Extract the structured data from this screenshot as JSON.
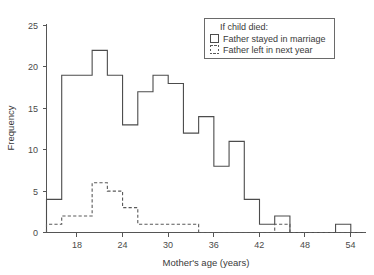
{
  "chart_data": {
    "type": "bar",
    "title": "",
    "xlabel": "Mother's age (years)",
    "ylabel": "Frequency",
    "xlim": [
      14,
      56
    ],
    "ylim": [
      0,
      25
    ],
    "xticks": [
      18,
      24,
      30,
      36,
      42,
      48,
      54
    ],
    "yticks": [
      0,
      5,
      10,
      15,
      20,
      25
    ],
    "grid": false,
    "bin_width": 2,
    "bin_edges": [
      14,
      16,
      18,
      20,
      22,
      24,
      26,
      28,
      30,
      32,
      34,
      36,
      38,
      40,
      42,
      44,
      46,
      48,
      50,
      52,
      54,
      56
    ],
    "legend_position": "top-right",
    "legend_title": "If child died:",
    "series": [
      {
        "name": "Father stayed in marriage",
        "style": "solid",
        "color": "#4c4c4c",
        "categories": [
          "14-16",
          "16-18",
          "18-20",
          "20-22",
          "22-24",
          "24-26",
          "26-28",
          "28-30",
          "30-32",
          "32-34",
          "34-36",
          "36-38",
          "38-40",
          "40-42",
          "42-44",
          "44-46",
          "46-48",
          "48-50",
          "50-52",
          "52-54",
          "54-56"
        ],
        "values": [
          4,
          19,
          19,
          22,
          19,
          13,
          17,
          19,
          18,
          12,
          14,
          8,
          11,
          4,
          1,
          2,
          0,
          0,
          0,
          1,
          0
        ]
      },
      {
        "name": "Father left in next year",
        "style": "dashed",
        "color": "#5a5a5a",
        "categories": [
          "14-16",
          "16-18",
          "18-20",
          "20-22",
          "22-24",
          "24-26",
          "26-28",
          "28-30",
          "30-32",
          "32-34",
          "34-36",
          "36-38",
          "38-40",
          "40-42",
          "42-44",
          "44-46",
          "46-48",
          "48-50",
          "50-52",
          "52-54",
          "54-56"
        ],
        "values": [
          1,
          2,
          2,
          6,
          5,
          3,
          1,
          1,
          1,
          1,
          0,
          0,
          0,
          0,
          0,
          1,
          0,
          0,
          0,
          0,
          0
        ]
      }
    ]
  },
  "axis": {
    "y_label": "Frequency",
    "x_label": "Mother's age (years)",
    "y_tick_labels": [
      "0",
      "5",
      "10",
      "15",
      "20",
      "25"
    ],
    "x_tick_labels": [
      "18",
      "24",
      "30",
      "36",
      "42",
      "48",
      "54"
    ]
  },
  "legend": {
    "title": "If child died:",
    "entries": [
      {
        "label": "Father stayed in marriage",
        "swatch": "solid-square-icon"
      },
      {
        "label": "Father left in next year",
        "swatch": "dashed-square-icon"
      }
    ]
  },
  "colors": {
    "solid_series": "#4c4c4c",
    "dashed_series": "#5a5a5a",
    "axis": "#555555",
    "background": "#ffffff"
  }
}
